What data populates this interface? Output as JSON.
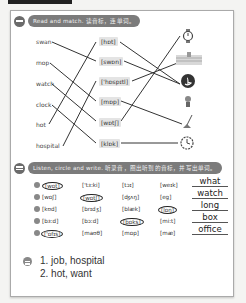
{
  "section1": {
    "title": "Read and match. 读音标，连单词。",
    "words": [
      "swan",
      "mop",
      "watch",
      "clock",
      "hot",
      "hospital"
    ],
    "phonetics": [
      "[hɒt]",
      "[swɒn]",
      "['hɒspɪtl]",
      "[mɒp]",
      "[wɒtʃ]",
      "[klɒk]"
    ],
    "pictures": [
      "watch-icon",
      "wall-icon",
      "swan-icon",
      "girl-icon",
      "mop-icon",
      "clock-icon"
    ]
  },
  "section2": {
    "title": "Listen, circle and write. 听录音，圈出听到的音标，并写出单词。",
    "rows": [
      {
        "n": "1",
        "cells": [
          "[wɒt]",
          "['tɜ:ki]",
          "[tɔɪ]",
          "[weɪk]"
        ],
        "circled": 0,
        "answer": "what"
      },
      {
        "n": "2",
        "cells": [
          "[wɒʃ]",
          "[wɒtʃ]",
          "[ʤʌŋ]",
          "[eg]"
        ],
        "circled": 1,
        "answer": "watch"
      },
      {
        "n": "3",
        "cells": [
          "[kʊd]",
          "[brɪdʒ]",
          "[blæk]",
          "[lɒŋ]"
        ],
        "circled": 3,
        "answer": "long"
      },
      {
        "n": "4",
        "cells": [
          "[bɜ:d]",
          "[bɔ:d]",
          "[bɒks]",
          "[mi:t]"
        ],
        "circled": 2,
        "answer": "box"
      },
      {
        "n": "5",
        "cells": [
          "['ɒfɪs]",
          "[maʊθ]",
          "[mɒp]",
          "[mæ]"
        ],
        "circled": 0,
        "answer": "office"
      }
    ]
  },
  "section3": {
    "lines": [
      "1. job, hospital",
      "2. hot, want"
    ]
  }
}
